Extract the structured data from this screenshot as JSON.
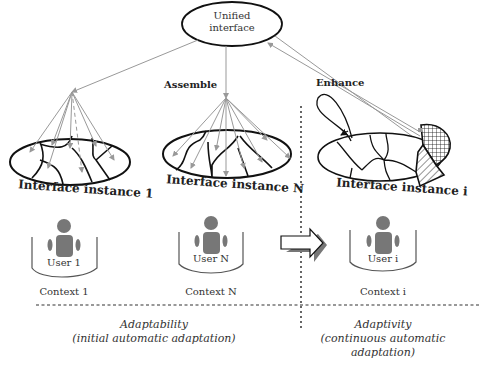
{
  "diagram": {
    "top_node": {
      "label_line1": "Unified",
      "label_line2": "interface"
    },
    "edges": {
      "assemble": "Assemble",
      "enhance": "Enhance"
    },
    "instances": [
      {
        "label": "Interface instance 1",
        "user": "User 1",
        "context": "Context 1"
      },
      {
        "label": "Interface instance N",
        "user": "User N",
        "context": "Context N"
      },
      {
        "label": "Interface instance i",
        "user": "User i",
        "context": "Context i"
      }
    ],
    "bottom": {
      "left": {
        "line1": "Adaptability",
        "line2": "(initial automatic adaptation)"
      },
      "right": {
        "line1": "Adaptivity",
        "line2": "(continuous automatic",
        "line3": "adaptation)"
      }
    },
    "colors": {
      "line": "#111111",
      "arrow_gray": "#999999",
      "user_fill": "#777777",
      "bucket": "#555555"
    }
  }
}
